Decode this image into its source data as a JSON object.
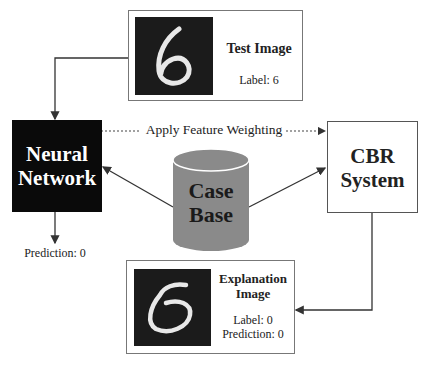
{
  "test_image": {
    "title": "Test Image",
    "label": "Label: 6"
  },
  "neural_network": {
    "title_line1": "Neural",
    "title_line2": "Network",
    "prediction": "Prediction: 0"
  },
  "feature_link": {
    "label": "Apply Feature Weighting"
  },
  "case_base": {
    "line1": "Case",
    "line2": "Base",
    "color": "#8a8a8a"
  },
  "cbr_system": {
    "line1": "CBR",
    "line2": "System"
  },
  "explanation_image": {
    "title_line1": "Explanation",
    "title_line2": "Image",
    "label": "Label: 0",
    "prediction": "Prediction: 0"
  }
}
